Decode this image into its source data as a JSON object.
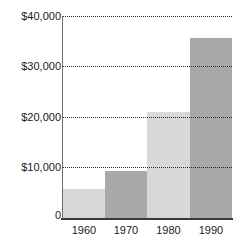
{
  "chart_data": {
    "type": "bar",
    "title": "",
    "subtitle": "",
    "xlabel": "",
    "ylabel": "",
    "categories": [
      "1960",
      "1970",
      "1980",
      "1990"
    ],
    "values": [
      5800,
      9400,
      20900,
      35600
    ],
    "series": [
      {
        "name": "",
        "values": [
          5800,
          9400,
          20900,
          35600
        ]
      }
    ],
    "ylim": [
      0,
      40000
    ],
    "xlim_categories": 4,
    "y_ticks": [
      0,
      10000,
      20000,
      30000,
      40000
    ],
    "y_tick_labels": [
      "0",
      "$10,000",
      "$20,000",
      "$30,000",
      "$40,000"
    ],
    "x_tick_labels": [
      "1960",
      "1970",
      "1980",
      "1990"
    ],
    "grid": {
      "horizontal": true,
      "vertical": false,
      "style": "dotted",
      "color": "#2b2b2b"
    },
    "legend": {
      "visible": false,
      "position": "none",
      "entries": []
    },
    "bar_colors": [
      "#d8d8d8",
      "#a9a9a9",
      "#d8d8d8",
      "#a9a9a9"
    ],
    "bar_gap": 0,
    "annotations": [],
    "axis_line_color": "#6e6e6e",
    "baseline_color": "#3a3a3a",
    "background_color": "#ffffff",
    "text_color": "#1a1a1a"
  }
}
